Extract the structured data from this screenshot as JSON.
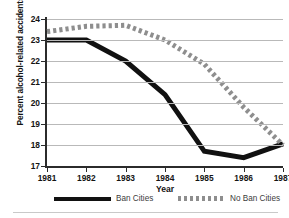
{
  "chart_data": {
    "type": "line",
    "title": "",
    "subtitle": "",
    "xlabel": "Year",
    "ylabel": "Percent alcohol-related accidents",
    "x": [
      1981,
      1982,
      1983,
      1984,
      1985,
      1986,
      1987
    ],
    "xtick_labels": [
      "1981",
      "1982",
      "1983",
      "1984",
      "1985",
      "1986",
      "1987"
    ],
    "ytick_labels": [
      "17",
      "18",
      "19",
      "20",
      "21",
      "22",
      "23",
      "24"
    ],
    "ytick_values": [
      17,
      18,
      19,
      20,
      21,
      22,
      23,
      24
    ],
    "ylim": [
      17,
      24
    ],
    "xlim": [
      1981,
      1987
    ],
    "grid": "horizontal",
    "legend_position": "bottom",
    "series": [
      {
        "name": "Ban Cities",
        "style": "solid",
        "color": "#111111",
        "line_width": 5,
        "values": [
          23.0,
          23.0,
          22.0,
          20.4,
          17.7,
          17.4,
          18.05
        ]
      },
      {
        "name": "No Ban Cities",
        "style": "dotted",
        "color": "#8e8e8e",
        "line_width": 5,
        "values": [
          23.4,
          23.65,
          23.7,
          23.0,
          21.85,
          19.8,
          18.0
        ]
      }
    ]
  },
  "axes": {
    "y_title": "Percent alcohol-related accidents",
    "x_title": "Year"
  },
  "legend": {
    "entries": [
      {
        "label": "Ban Cities",
        "swatch": "solid-line-swatch"
      },
      {
        "label": "No Ban Cities",
        "swatch": "dotted-line-swatch"
      }
    ]
  },
  "colors": {
    "ban_cities": "#111111",
    "no_ban_cities": "#8e8e8e",
    "gridline": "#b9b9b9",
    "axis": "#2b2b2b",
    "text": "#141414"
  }
}
